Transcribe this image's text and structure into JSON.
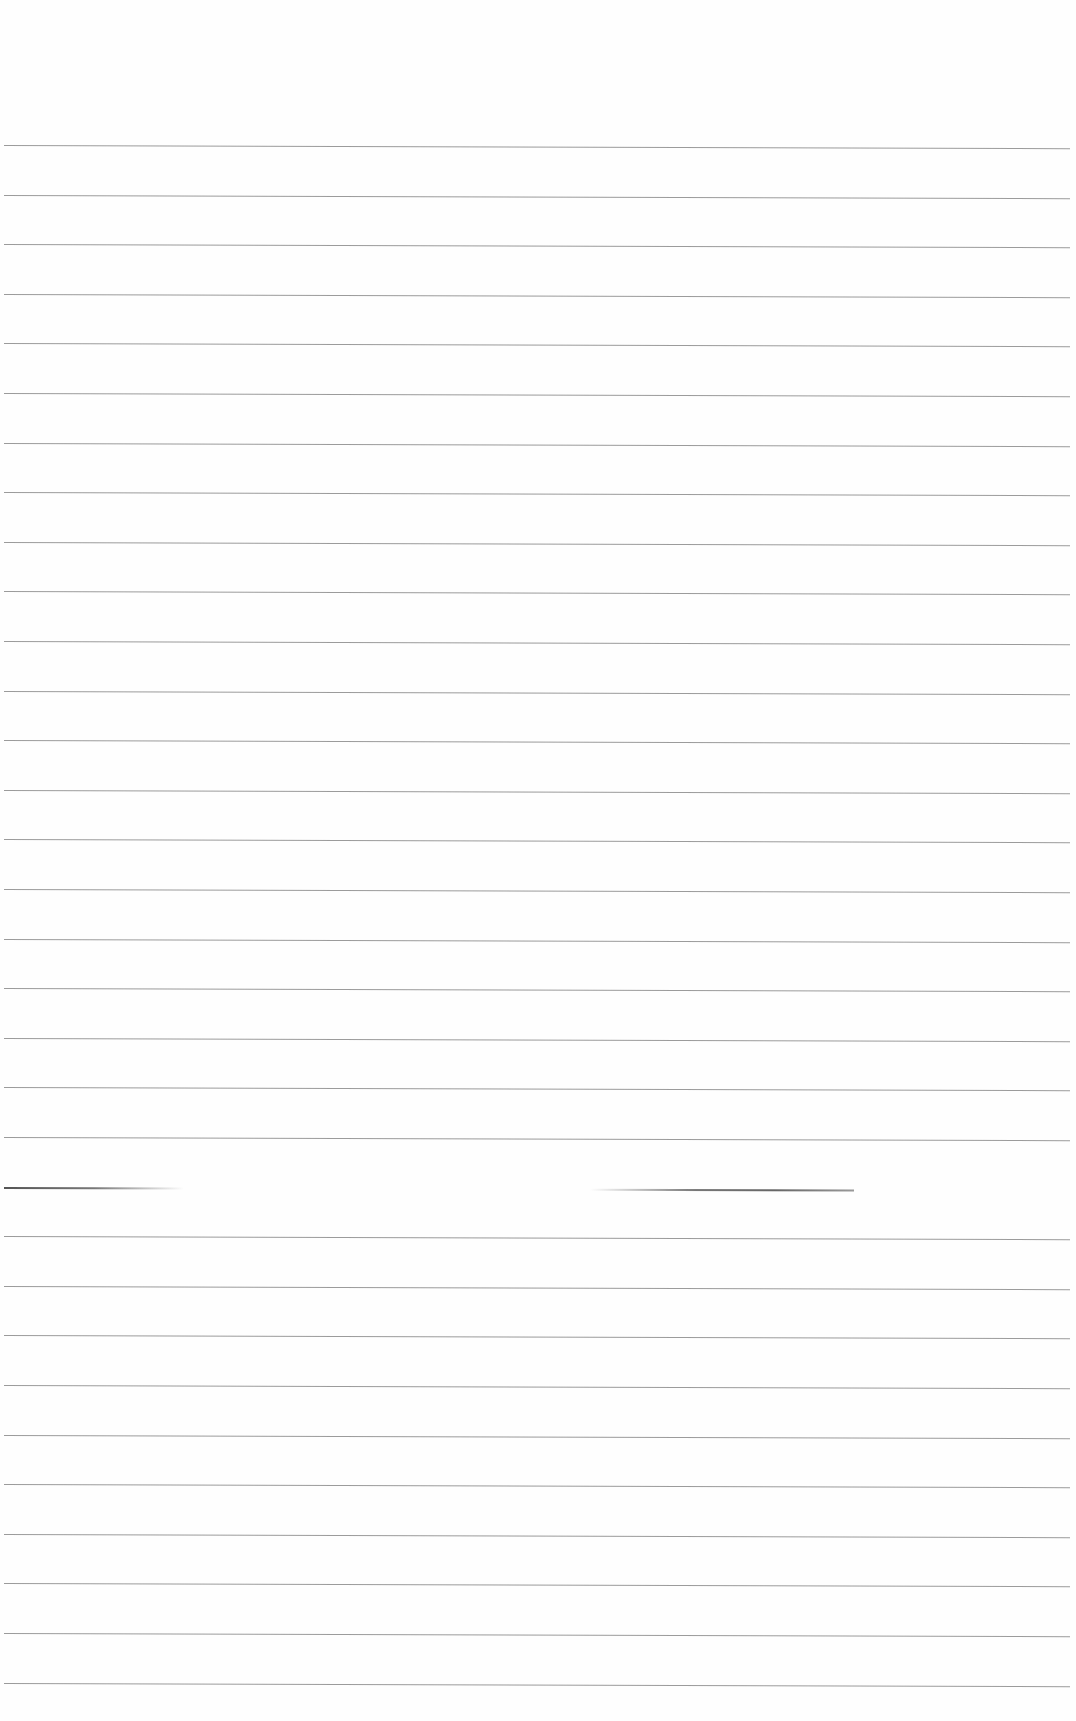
{
  "page": {
    "type": "blank lined paper",
    "background": "#fefefe",
    "rule_color": "#8a8a8a",
    "rule_count": 32,
    "first_rule_y": 145,
    "rule_spacing": 49.6,
    "faded_rule_index": 21
  },
  "text_content": []
}
